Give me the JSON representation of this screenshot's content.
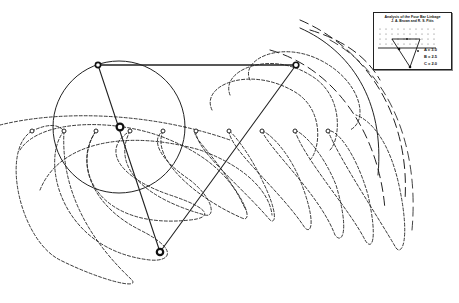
{
  "diagram": {
    "type": "four-bar-linkage coupler curves",
    "background": "#ffffff",
    "ink": "#111111",
    "crank_circle": {
      "cx": 119,
      "cy": 127,
      "r": 66
    },
    "pivots": {
      "crank_top": {
        "x": 98,
        "y": 65
      },
      "rocker_top": {
        "x": 296,
        "y": 65
      },
      "crank_center": {
        "x": 120,
        "y": 127
      },
      "coupler_bottom": {
        "x": 160,
        "y": 252
      }
    },
    "trace_points_y": 131,
    "trace_points_x": [
      32,
      64,
      96,
      130,
      163,
      196,
      229,
      262,
      295,
      328
    ]
  },
  "legend": {
    "title": "Analysis of the Four Bar Linkage",
    "subtitle": "J. A. Brown and R. S. Pitts",
    "values": [
      {
        "label": "A = 3.0"
      },
      {
        "label": "B = 2.5"
      },
      {
        "label": "C = 2.0"
      }
    ]
  }
}
